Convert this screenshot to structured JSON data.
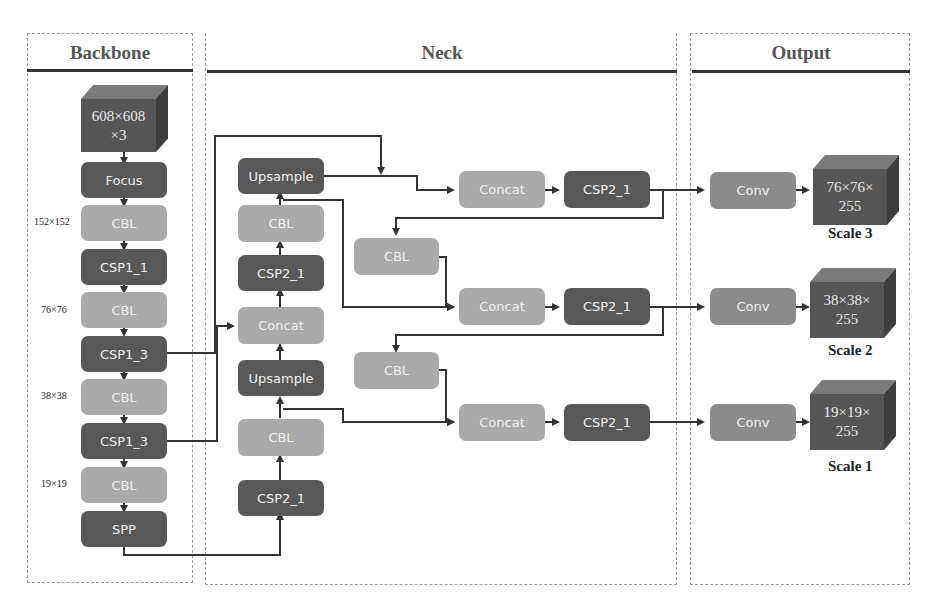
{
  "sections": {
    "backbone": {
      "title": "Backbone"
    },
    "neck": {
      "title": "Neck"
    },
    "output": {
      "title": "Output"
    }
  },
  "backbone": {
    "input": {
      "line1": "608×608",
      "line2": "×3"
    },
    "blocks": [
      "Focus",
      "CBL",
      "CSP1_1",
      "CBL",
      "CSP1_3",
      "CBL",
      "CSP1_3",
      "CBL",
      "SPP"
    ],
    "dims": [
      "152×152",
      "76×76",
      "38×38",
      "19×19"
    ]
  },
  "neck": {
    "column": [
      "Upsample",
      "CBL",
      "CSP2_1",
      "Concat",
      "Upsample",
      "CBL",
      "CSP2_1"
    ],
    "side_cbl": [
      "CBL",
      "CBL"
    ],
    "concat": [
      "Concat",
      "Concat",
      "Concat"
    ],
    "csp": [
      "CSP2_1",
      "CSP2_1",
      "CSP2_1"
    ]
  },
  "output": {
    "conv": [
      "Conv",
      "Conv",
      "Conv"
    ],
    "cubes": [
      {
        "line1": "76×76×",
        "line2": "255",
        "scale": "Scale 3"
      },
      {
        "line1": "38×38×",
        "line2": "255",
        "scale": "Scale 2"
      },
      {
        "line1": "19×19×",
        "line2": "255",
        "scale": "Scale 1"
      }
    ]
  },
  "colors": {
    "dark": "#585858",
    "light": "#aaaaaa",
    "mid": "#8c8c8c",
    "line": "#333333"
  }
}
